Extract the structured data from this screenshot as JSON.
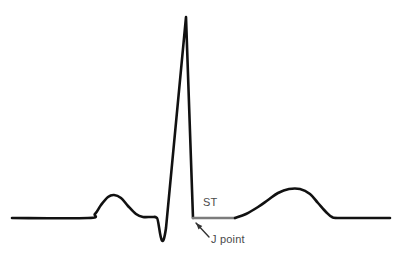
{
  "figure": {
    "width": 400,
    "height": 254,
    "background": "#ffffff"
  },
  "chart_data": {
    "type": "line",
    "title": "",
    "xlabel": "",
    "ylabel": "",
    "xlim": [
      0,
      400
    ],
    "ylim": [
      254,
      0
    ],
    "grid": false,
    "legend": false,
    "baseline_y": 218,
    "series": [
      {
        "name": "ecg-trace-pre-st",
        "color": "#111111",
        "stroke_width": 2.6,
        "points": [
          [
            12,
            218
          ],
          [
            88,
            218
          ],
          [
            95,
            214
          ],
          [
            101,
            205
          ],
          [
            108,
            197
          ],
          [
            114,
            195
          ],
          [
            121,
            198
          ],
          [
            128,
            206
          ],
          [
            136,
            214
          ],
          [
            143,
            217
          ],
          [
            152,
            217
          ],
          [
            157,
            218
          ],
          [
            166,
            228
          ],
          [
            186,
            17
          ],
          [
            193,
            218
          ]
        ]
      },
      {
        "name": "st-segment",
        "color": "#7c7c7c",
        "stroke_width": 2.6,
        "points": [
          [
            193,
            218
          ],
          [
            235,
            218
          ]
        ]
      },
      {
        "name": "ecg-trace-t-wave",
        "color": "#111111",
        "stroke_width": 2.6,
        "points": [
          [
            235,
            218
          ],
          [
            246,
            214
          ],
          [
            258,
            207
          ],
          [
            268,
            200
          ],
          [
            278,
            193
          ],
          [
            289,
            189
          ],
          [
            300,
            189
          ],
          [
            310,
            194
          ],
          [
            318,
            203
          ],
          [
            326,
            212
          ],
          [
            332,
            217
          ],
          [
            340,
            218
          ],
          [
            390,
            218
          ]
        ]
      }
    ],
    "annotations": [
      {
        "name": "st-label",
        "text": "ST",
        "x": 203,
        "y": 206,
        "color": "#4a4a4a"
      },
      {
        "name": "j-point-label",
        "text": "J point",
        "x": 211,
        "y": 243,
        "color": "#4a4a4a"
      },
      {
        "name": "j-point-arrow",
        "from": [
          209,
          237
        ],
        "to": [
          196,
          223
        ],
        "color": "#333333"
      }
    ]
  },
  "labels": {
    "st": "ST",
    "j_point": "J point"
  },
  "colors": {
    "trace": "#111111",
    "st_segment": "#7c7c7c",
    "text": "#4a4a4a",
    "arrow": "#333333",
    "background": "#ffffff"
  }
}
